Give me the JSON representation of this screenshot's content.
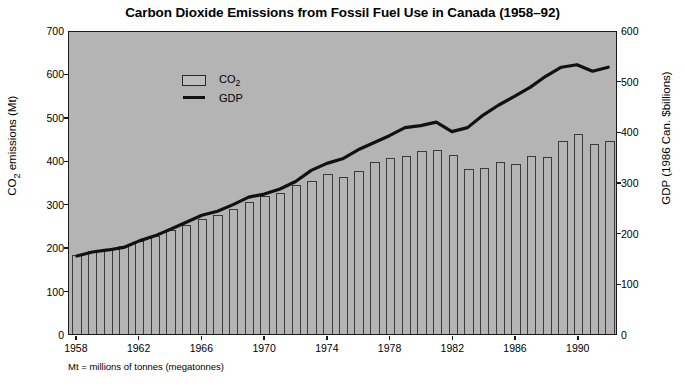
{
  "chart_data": {
    "type": "bar",
    "title": "Carbon Dioxide Emissions from Fossil Fuel Use in Canada (1958–92)",
    "footnote": "Mt = millions of tonnes (megatonnes)",
    "xlabel": "",
    "ylabel": "CO2 emissions (Mt)",
    "ylabel_secondary": "GDP (1986 Can. $billions)",
    "ylim": [
      0,
      700
    ],
    "ylim_secondary": [
      0,
      600
    ],
    "ytick_labels": [
      "0",
      "100",
      "200",
      "300",
      "400",
      "500",
      "600",
      "700"
    ],
    "ytick_labels_secondary": [
      "0",
      "100",
      "200",
      "300",
      "400",
      "500",
      "600"
    ],
    "grid": false,
    "legend_position": "top-left",
    "x": [
      1958,
      1959,
      1960,
      1961,
      1962,
      1963,
      1964,
      1965,
      1966,
      1967,
      1968,
      1969,
      1970,
      1971,
      1972,
      1973,
      1974,
      1975,
      1976,
      1977,
      1978,
      1979,
      1980,
      1981,
      1982,
      1983,
      1984,
      1985,
      1986,
      1987,
      1988,
      1989,
      1990,
      1991,
      1992
    ],
    "xtick_labels": [
      "1958",
      "1962",
      "1966",
      "1970",
      "1974",
      "1978",
      "1982",
      "1986",
      "1990"
    ],
    "xtick_values": [
      1958,
      1962,
      1966,
      1970,
      1974,
      1978,
      1982,
      1986,
      1990
    ],
    "series": [
      {
        "name": "CO2",
        "kind": "bar",
        "axis": "left",
        "unit": "Mt",
        "values": [
          183,
          192,
          196,
          203,
          215,
          226,
          240,
          252,
          265,
          275,
          288,
          303,
          318,
          325,
          343,
          352,
          368,
          362,
          375,
          396,
          405,
          411,
          422,
          424,
          412,
          380,
          383,
          396,
          392,
          410,
          407,
          444,
          460,
          438,
          445
        ]
      },
      {
        "name": "GDP",
        "kind": "line",
        "axis": "right",
        "unit": "1986 Can. $billions",
        "values": [
          155,
          163,
          167,
          172,
          185,
          195,
          208,
          222,
          236,
          244,
          257,
          272,
          278,
          288,
          303,
          325,
          339,
          348,
          366,
          380,
          394,
          410,
          414,
          421,
          402,
          410,
          435,
          455,
          472,
          490,
          512,
          530,
          535,
          522,
          530
        ]
      }
    ],
    "legend": [
      {
        "label": "CO2",
        "type": "bar-swatch"
      },
      {
        "label": "GDP",
        "type": "line-swatch"
      }
    ],
    "colors": {
      "plot_background": "#b4b4b4",
      "axis": "#1a1a1a",
      "bar_outline": "#3a3a3a",
      "line": "#111111",
      "page_background": "#ffffff"
    }
  }
}
